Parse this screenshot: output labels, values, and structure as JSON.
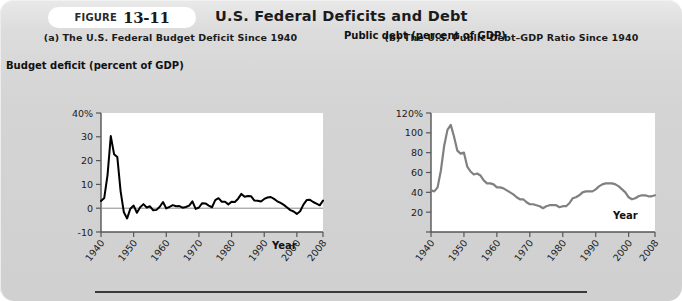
{
  "figure": {
    "label_word": "FIGURE",
    "number": "13-11",
    "title": "U.S. Federal Deficits and Debt"
  },
  "panel_a": {
    "title": "(a) The U.S. Federal Budget Deficit Since 1940",
    "y_axis_title": "Budget deficit (percent of GDP)",
    "x_axis_title": "Year"
  },
  "panel_b": {
    "title": "(b) The U.S. Public Debt–GDP Ratio Since 1940",
    "y_axis_title": "Public debt (percent of GDP)",
    "x_axis_title": "Year"
  },
  "colors": {
    "panel_background": "#d3d3d3",
    "plot_background": "#ffffff",
    "deficit_line": "#000000",
    "debt_line": "#808080",
    "axis": "#555555",
    "text": "#1b1b1b"
  },
  "chart_data": [
    {
      "type": "line",
      "title": "(a) The U.S. Federal Budget Deficit Since 1940",
      "xlabel": "Year",
      "ylabel": "Budget deficit (percent of GDP)",
      "xlim": [
        1940,
        2008
      ],
      "ylim": [
        -10,
        40
      ],
      "xticks": [
        1940,
        1950,
        1960,
        1970,
        1980,
        1990,
        2000,
        2008
      ],
      "yticks": [
        -10,
        0,
        10,
        20,
        30,
        40
      ],
      "ytick_labels": [
        "-10",
        "0",
        "10",
        "20",
        "30",
        "40%"
      ],
      "grid": false,
      "legend": "none",
      "zero_line": true,
      "series": [
        {
          "name": "Federal budget deficit (% of GDP)",
          "color": "#000000",
          "x": [
            1940,
            1941,
            1942,
            1943,
            1944,
            1945,
            1946,
            1947,
            1948,
            1949,
            1950,
            1951,
            1952,
            1953,
            1954,
            1955,
            1956,
            1957,
            1958,
            1959,
            1960,
            1961,
            1962,
            1963,
            1964,
            1965,
            1966,
            1967,
            1968,
            1969,
            1970,
            1971,
            1972,
            1973,
            1974,
            1975,
            1976,
            1977,
            1978,
            1979,
            1980,
            1981,
            1982,
            1983,
            1984,
            1985,
            1986,
            1987,
            1988,
            1989,
            1990,
            1991,
            1992,
            1993,
            1994,
            1995,
            1996,
            1997,
            1998,
            1999,
            2000,
            2001,
            2002,
            2003,
            2004,
            2005,
            2006,
            2007,
            2008
          ],
          "values": [
            3.0,
            4.3,
            13.9,
            30.3,
            22.7,
            21.5,
            7.2,
            -1.7,
            -4.3,
            -0.2,
            1.1,
            -1.9,
            0.4,
            1.7,
            0.3,
            0.8,
            -0.9,
            -0.7,
            0.6,
            2.6,
            -0.1,
            0.6,
            1.3,
            0.8,
            0.9,
            0.2,
            0.5,
            1.1,
            2.9,
            -0.3,
            0.3,
            2.1,
            2.0,
            1.1,
            0.4,
            3.4,
            4.2,
            2.7,
            2.7,
            1.6,
            2.7,
            2.6,
            4.0,
            6.0,
            4.8,
            5.1,
            5.0,
            3.2,
            3.1,
            2.8,
            3.9,
            4.5,
            4.7,
            3.9,
            2.9,
            2.2,
            1.4,
            0.3,
            -0.8,
            -1.4,
            -2.4,
            -1.3,
            1.5,
            3.4,
            3.5,
            2.6,
            1.9,
            1.2,
            3.2
          ]
        }
      ]
    },
    {
      "type": "line",
      "title": "(b) The U.S. Public Debt–GDP Ratio Since 1940",
      "xlabel": "Year",
      "ylabel": "Public debt (percent of GDP)",
      "xlim": [
        1940,
        2008
      ],
      "ylim": [
        0,
        120
      ],
      "xticks": [
        1940,
        1950,
        1960,
        1970,
        1980,
        1990,
        2000,
        2008
      ],
      "yticks": [
        0,
        20,
        40,
        60,
        80,
        100,
        120
      ],
      "ytick_labels": [
        "",
        "20",
        "40",
        "60",
        "80",
        "100",
        "120%"
      ],
      "grid": false,
      "legend": "none",
      "series": [
        {
          "name": "Public debt as percent of GDP",
          "color": "#808080",
          "x": [
            1940,
            1941,
            1942,
            1943,
            1944,
            1945,
            1946,
            1947,
            1948,
            1949,
            1950,
            1951,
            1952,
            1953,
            1954,
            1955,
            1956,
            1957,
            1958,
            1959,
            1960,
            1961,
            1962,
            1963,
            1964,
            1965,
            1966,
            1967,
            1968,
            1969,
            1970,
            1971,
            1972,
            1973,
            1974,
            1975,
            1976,
            1977,
            1978,
            1979,
            1980,
            1981,
            1982,
            1983,
            1984,
            1985,
            1986,
            1987,
            1988,
            1989,
            1990,
            1991,
            1992,
            1993,
            1994,
            1995,
            1996,
            1997,
            1998,
            1999,
            2000,
            2001,
            2002,
            2003,
            2004,
            2005,
            2006,
            2007,
            2008
          ],
          "values": [
            42.0,
            41.0,
            45.0,
            62.0,
            87.0,
            103.0,
            108.0,
            96.0,
            82.0,
            79.0,
            80.0,
            66.0,
            61.0,
            58.0,
            59.0,
            57.0,
            52.0,
            49.0,
            49.0,
            48.0,
            45.0,
            45.0,
            44.0,
            42.0,
            40.0,
            38.0,
            35.0,
            33.0,
            33.0,
            30.0,
            28.0,
            28.0,
            27.0,
            26.0,
            24.0,
            26.0,
            27.0,
            27.0,
            27.0,
            25.0,
            26.0,
            26.0,
            29.0,
            34.0,
            35.0,
            37.0,
            40.0,
            41.0,
            41.0,
            41.0,
            43.0,
            46.0,
            48.0,
            49.0,
            49.0,
            49.0,
            48.0,
            46.0,
            43.0,
            40.0,
            35.0,
            33.0,
            34.0,
            36.0,
            37.0,
            37.0,
            36.0,
            36.0,
            37.0
          ]
        }
      ]
    }
  ]
}
